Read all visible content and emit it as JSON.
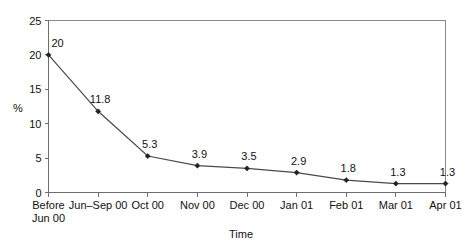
{
  "chart_data": {
    "type": "line",
    "title": "",
    "xlabel": "Time",
    "ylabel": "%",
    "categories": [
      "Before\nJun 00",
      "Jun–Sep 00",
      "Oct 00",
      "Nov 00",
      "Dec 00",
      "Jan 01",
      "Feb 01",
      "Mar 01",
      "Apr 01"
    ],
    "category_lines": [
      [
        "Before",
        "Jun 00"
      ],
      [
        "Jun–Sep 00"
      ],
      [
        "Oct 00"
      ],
      [
        "Nov 00"
      ],
      [
        "Dec 00"
      ],
      [
        "Jan 01"
      ],
      [
        "Feb 01"
      ],
      [
        "Mar 01"
      ],
      [
        "Apr 01"
      ]
    ],
    "values": [
      20,
      11.8,
      5.3,
      3.9,
      3.5,
      2.9,
      1.8,
      1.3,
      1.3
    ],
    "point_labels": [
      "20",
      "11.8",
      "5.3",
      "3.9",
      "3.5",
      "2.9",
      "1.8",
      "1.3",
      "1.3"
    ],
    "ylim": [
      0,
      25
    ],
    "yticks": [
      0,
      5,
      10,
      15,
      20,
      25
    ],
    "ytick_labels": [
      "0",
      "5",
      "10",
      "15",
      "20",
      "25"
    ],
    "grid": false,
    "legend": "none",
    "marker": "diamond",
    "colors": {
      "line": "#4a4a4a",
      "marker": "#222222",
      "axis": "#6e6e6e",
      "frame": "#8a8a8a",
      "text": "#111111",
      "background": "#ffffff"
    }
  }
}
